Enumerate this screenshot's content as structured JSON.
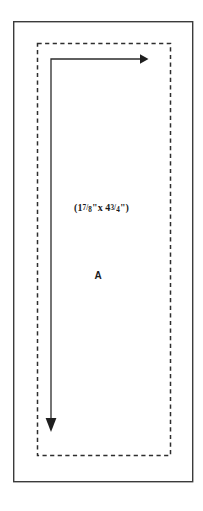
{
  "figure": {
    "background_color": "#ffffff",
    "stroke_color": "#3b3b3b",
    "path_color": "#2b2b2b",
    "text_color": "#1a1a1a",
    "outer_border": {
      "name": "outer-solid-rectangle",
      "style": "solid",
      "x": 13,
      "y": 21,
      "width": 180,
      "height": 461
    },
    "inner_border": {
      "name": "inner-dashed-rectangle",
      "style": "dashed",
      "dash": "4,3",
      "x": 37,
      "y": 43,
      "width": 133,
      "height": 412
    },
    "path": {
      "name": "traversal-arrow-path",
      "corner": {
        "x": 51,
        "y": 59
      },
      "horizontal_arrow_tip": {
        "x": 147,
        "y": 59
      },
      "vertical_arrow_tip": {
        "x": 51,
        "y": 432
      }
    },
    "labels": {
      "dimension": {
        "full_text": "(1 7/8\" x 4 3/4\")",
        "open_paren": "(",
        "whole_1": "1",
        "num_1": "7",
        "slash_1": "/",
        "den_1": "8",
        "quote_1": "\"",
        "times": "x",
        "whole_2": "4",
        "num_2": "3",
        "slash_2": "/",
        "den_2": "4",
        "quote_2": "\"",
        "close_paren": ")"
      },
      "region": "A"
    }
  }
}
